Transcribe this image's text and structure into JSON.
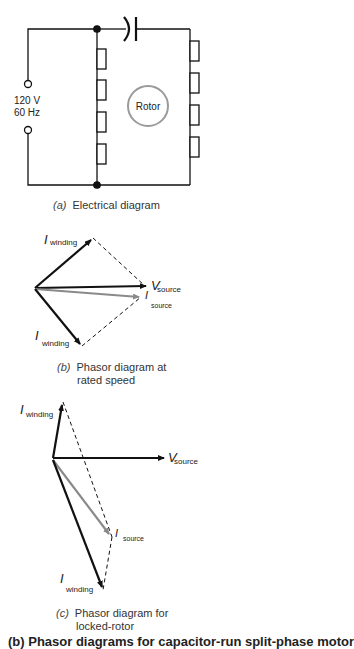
{
  "circuit": {
    "source_voltage": "120 V",
    "source_frequency": "60 Hz",
    "rotor_label": "Rotor",
    "caption_letter": "(a)",
    "caption_text": "Electrical diagram"
  },
  "phasor_rated": {
    "i_winding_main": "I",
    "i_winding_sub": "winding",
    "v_source_main": "V",
    "v_source_sub": "source",
    "i_source_main": "I",
    "i_source_sub": "source",
    "caption_letter": "(b)",
    "caption_line1": "Phasor diagram at",
    "caption_line2": "rated speed"
  },
  "phasor_locked": {
    "i_winding_main": "I",
    "i_winding_sub": "winding",
    "v_source_main": "V",
    "v_source_sub": "source",
    "i_source_main": "I",
    "i_source_sub": "source",
    "caption_letter": "(c)",
    "caption_line1": "Phasor diagram for",
    "caption_line2": "locked-rotor"
  },
  "figure_caption_partial": "(b) Phasor diagrams for capacitor-run split-phase motor",
  "colors": {
    "ink": "#111111",
    "source_current": "#8a8a8a",
    "rotor": "#9a9a9a"
  }
}
